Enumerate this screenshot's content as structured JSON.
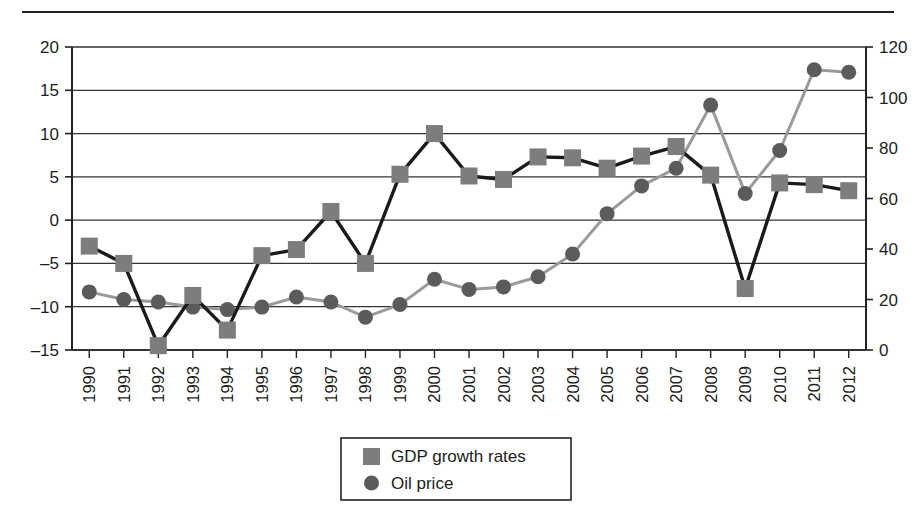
{
  "figure": {
    "background": "#ffffff",
    "top_rule": true
  },
  "chart_data": {
    "type": "line",
    "title": "",
    "subtitle": "",
    "xlabel": "",
    "ylabel": "",
    "grid": true,
    "legend_position": "bottom-center",
    "categories": [
      "1990",
      "1991",
      "1992",
      "1993",
      "1994",
      "1995",
      "1996",
      "1997",
      "1998",
      "1999",
      "2000",
      "2001",
      "2002",
      "2003",
      "2004",
      "2005",
      "2006",
      "2007",
      "2008",
      "2009",
      "2010",
      "2011",
      "2012"
    ],
    "axes": {
      "left": {
        "label": "",
        "ylim": [
          -15,
          20
        ],
        "ticks": [
          -15,
          -10,
          -5,
          0,
          5,
          10,
          15,
          20
        ],
        "tick_labels": [
          "–15",
          "–10",
          "–5",
          "0",
          "5",
          "10",
          "15",
          "20"
        ]
      },
      "right": {
        "label": "",
        "ylim": [
          0,
          120
        ],
        "ticks": [
          0,
          20,
          40,
          60,
          80,
          100,
          120
        ],
        "tick_labels": [
          "0",
          "20",
          "40",
          "60",
          "80",
          "100",
          "120"
        ]
      }
    },
    "series": [
      {
        "name": "GDP growth rates",
        "axis": "left",
        "marker": "square",
        "marker_color": "#7d7d7d",
        "line_color": "#1a1a1a",
        "values": [
          -3.0,
          -5.0,
          -14.5,
          -8.7,
          -12.7,
          -4.1,
          -3.4,
          1.0,
          -5.0,
          5.3,
          10.0,
          5.1,
          4.7,
          7.3,
          7.2,
          6.0,
          7.4,
          8.5,
          5.2,
          -7.9,
          4.3,
          4.1,
          3.4
        ]
      },
      {
        "name": "Oil price",
        "axis": "right",
        "marker": "circle",
        "marker_color": "#5b5b5b",
        "line_color": "#9a9a9a",
        "values": [
          23,
          20,
          19,
          17,
          16,
          17,
          21,
          19,
          13,
          18,
          28,
          24,
          25,
          29,
          38,
          54,
          65,
          72,
          97,
          62,
          79,
          111,
          110
        ]
      }
    ]
  },
  "legend": {
    "items": [
      {
        "label": "GDP growth rates",
        "marker": "square",
        "color": "#7d7d7d"
      },
      {
        "label": "Oil price",
        "marker": "circle",
        "color": "#5b5b5b"
      }
    ]
  }
}
